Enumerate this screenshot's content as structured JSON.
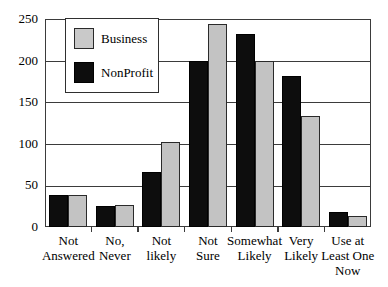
{
  "chart_data": {
    "type": "bar",
    "title": "",
    "xlabel": "",
    "ylabel": "",
    "ylim": [
      0,
      250
    ],
    "yticks": [
      "0",
      "50",
      "100",
      "150",
      "200",
      "250"
    ],
    "ytick_values": [
      0,
      50,
      100,
      150,
      200,
      250
    ],
    "grid": true,
    "legend_position": "upper-left-inside",
    "categories": [
      "Not Answered",
      "No, Never",
      "Not likely",
      "Not Sure",
      "Somewhat Likely",
      "Very Likely",
      "Use at Least One Now"
    ],
    "category_lines": [
      [
        "Not",
        "Answered"
      ],
      [
        "No,",
        "Never"
      ],
      [
        "Not",
        "likely"
      ],
      [
        "Not",
        "Sure"
      ],
      [
        "Somewhat",
        "Likely"
      ],
      [
        "Very",
        "Likely"
      ],
      [
        "Use at",
        "Least One",
        "Now"
      ]
    ],
    "series": [
      {
        "name": "NonProfit",
        "color": "#0d0d0d",
        "values": [
          38,
          25,
          66,
          200,
          232,
          182,
          18
        ]
      },
      {
        "name": "Business",
        "color": "#c3c3c3",
        "values": [
          38,
          27,
          102,
          244,
          200,
          133,
          13
        ]
      }
    ]
  },
  "legend": {
    "items": [
      {
        "label": "Business",
        "swatch": "business"
      },
      {
        "label": "NonProfit",
        "swatch": "nonprofit"
      }
    ]
  }
}
